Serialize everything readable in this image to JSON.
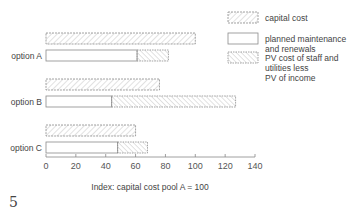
{
  "chart_data": {
    "type": "bar",
    "orientation": "horizontal",
    "layout": "grouped-stacked",
    "title": "",
    "xlabel": "Index: capital cost pool A = 100",
    "ylabel": "",
    "xlim": [
      0,
      140
    ],
    "xticks": [
      0,
      20,
      40,
      60,
      80,
      100,
      120,
      140
    ],
    "grid": false,
    "legend_position": "top-right",
    "categories": [
      "option A",
      "option B",
      "option C"
    ],
    "series": [
      {
        "name": "capital cost",
        "pattern": "diagonal-hatch-dashed",
        "values": [
          100,
          76,
          60
        ]
      },
      {
        "name": "planned maintenance and renewals",
        "pattern": "plain",
        "values": [
          61,
          44,
          48
        ]
      },
      {
        "name": "PV cost of staff and utilities less PV of income",
        "pattern": "diagonal-hatch",
        "values": [
          21,
          83,
          20
        ]
      }
    ],
    "stacks": {
      "capital": [
        "capital cost"
      ],
      "operating": [
        "planned maintenance and renewals",
        "PV cost of staff and utilities less PV of income"
      ]
    },
    "operating_totals": [
      82,
      127,
      68
    ],
    "figure_number": "5"
  },
  "legend": [
    {
      "label_lines": [
        "capital cost"
      ]
    },
    {
      "label_lines": [
        "planned maintenance",
        "and renewals"
      ]
    },
    {
      "label_lines": [
        "PV cost of staff and",
        "utilities less",
        "PV of income"
      ]
    }
  ],
  "colors": {
    "outline": "#8a8a8a",
    "hatch": "#b5b5b5",
    "text": "#444444",
    "axis": "#888888"
  }
}
